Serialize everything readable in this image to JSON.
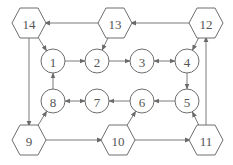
{
  "diagram": {
    "type": "directed-graph",
    "colors": {
      "stroke": "#6e6e6e",
      "label": "#555555",
      "background": "#ffffff"
    },
    "nodes": [
      {
        "id": "1",
        "label": "1",
        "shape": "circle",
        "x": 53,
        "y": 61
      },
      {
        "id": "2",
        "label": "2",
        "shape": "circle",
        "x": 97,
        "y": 61
      },
      {
        "id": "3",
        "label": "3",
        "shape": "circle",
        "x": 142,
        "y": 61
      },
      {
        "id": "4",
        "label": "4",
        "shape": "circle",
        "x": 187,
        "y": 61
      },
      {
        "id": "5",
        "label": "5",
        "shape": "circle",
        "x": 187,
        "y": 101
      },
      {
        "id": "6",
        "label": "6",
        "shape": "circle",
        "x": 142,
        "y": 101
      },
      {
        "id": "7",
        "label": "7",
        "shape": "circle",
        "x": 97,
        "y": 101
      },
      {
        "id": "8",
        "label": "8",
        "shape": "circle",
        "x": 53,
        "y": 101
      },
      {
        "id": "9",
        "label": "9",
        "shape": "hexagon",
        "x": 29,
        "y": 140
      },
      {
        "id": "10",
        "label": "10",
        "shape": "hexagon",
        "x": 118,
        "y": 140
      },
      {
        "id": "11",
        "label": "11",
        "shape": "hexagon",
        "x": 206,
        "y": 140
      },
      {
        "id": "12",
        "label": "12",
        "shape": "hexagon",
        "x": 206,
        "y": 23
      },
      {
        "id": "13",
        "label": "13",
        "shape": "hexagon",
        "x": 115,
        "y": 23
      },
      {
        "id": "14",
        "label": "14",
        "shape": "hexagon",
        "x": 29,
        "y": 23
      }
    ],
    "edges": [
      {
        "from": "12",
        "to": "13",
        "bidirectional": false
      },
      {
        "from": "13",
        "to": "14",
        "bidirectional": false
      },
      {
        "from": "14",
        "to": "1",
        "bidirectional": false
      },
      {
        "from": "13",
        "to": "2",
        "bidirectional": false
      },
      {
        "from": "12",
        "to": "4",
        "bidirectional": false
      },
      {
        "from": "1",
        "to": "2",
        "bidirectional": false
      },
      {
        "from": "2",
        "to": "3",
        "bidirectional": false
      },
      {
        "from": "3",
        "to": "4",
        "bidirectional": true
      },
      {
        "from": "4",
        "to": "5",
        "bidirectional": false
      },
      {
        "from": "5",
        "to": "6",
        "bidirectional": false
      },
      {
        "from": "6",
        "to": "7",
        "bidirectional": false
      },
      {
        "from": "7",
        "to": "8",
        "bidirectional": true
      },
      {
        "from": "8",
        "to": "1",
        "bidirectional": false
      },
      {
        "from": "14",
        "to": "9",
        "bidirectional": false
      },
      {
        "from": "9",
        "to": "8",
        "bidirectional": false
      },
      {
        "from": "9",
        "to": "10",
        "bidirectional": false
      },
      {
        "from": "10",
        "to": "6",
        "bidirectional": false
      },
      {
        "from": "10",
        "to": "11",
        "bidirectional": false
      },
      {
        "from": "11",
        "to": "5",
        "bidirectional": false
      },
      {
        "from": "11",
        "to": "12",
        "bidirectional": false
      }
    ]
  }
}
